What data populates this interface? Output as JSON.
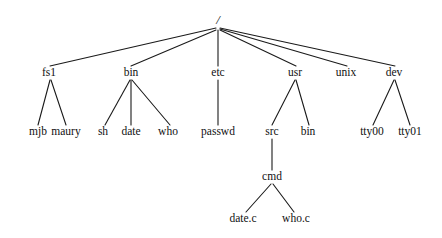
{
  "diagram": {
    "type": "tree",
    "background_color": "#ffffff",
    "line_color": "#1a1a1a",
    "text_color": "#111111",
    "nodes": [
      {
        "id": "root",
        "label": "/",
        "x": 218,
        "y": 24,
        "level": 0
      },
      {
        "id": "fs1",
        "label": "fs1",
        "x": 49,
        "y": 76,
        "level": 1
      },
      {
        "id": "bin",
        "label": "bin",
        "x": 131,
        "y": 76,
        "level": 1
      },
      {
        "id": "etc",
        "label": "etc",
        "x": 218,
        "y": 76,
        "level": 1
      },
      {
        "id": "usr",
        "label": "usr",
        "x": 295,
        "y": 76,
        "level": 1
      },
      {
        "id": "unix",
        "label": "unix",
        "x": 346,
        "y": 76,
        "level": 1
      },
      {
        "id": "dev",
        "label": "dev",
        "x": 394,
        "y": 76,
        "level": 1
      },
      {
        "id": "mjb",
        "label": "mjb",
        "x": 38,
        "y": 135,
        "level": 2
      },
      {
        "id": "maury",
        "label": "maury",
        "x": 66,
        "y": 135,
        "level": 2
      },
      {
        "id": "sh",
        "label": "sh",
        "x": 103,
        "y": 135,
        "level": 2
      },
      {
        "id": "date",
        "label": "date",
        "x": 131,
        "y": 135,
        "level": 2
      },
      {
        "id": "who",
        "label": "who",
        "x": 168,
        "y": 135,
        "level": 2
      },
      {
        "id": "passwd",
        "label": "passwd",
        "x": 218,
        "y": 135,
        "level": 2
      },
      {
        "id": "src",
        "label": "src",
        "x": 272,
        "y": 135,
        "level": 2
      },
      {
        "id": "usrbin",
        "label": "bin",
        "x": 308,
        "y": 135,
        "level": 2
      },
      {
        "id": "tty00",
        "label": "tty00",
        "x": 372,
        "y": 135,
        "level": 2
      },
      {
        "id": "tty01",
        "label": "tty01",
        "x": 410,
        "y": 135,
        "level": 2
      },
      {
        "id": "cmd",
        "label": "cmd",
        "x": 272,
        "y": 180,
        "level": 3
      },
      {
        "id": "datec",
        "label": "date.c",
        "x": 243,
        "y": 222,
        "level": 4
      },
      {
        "id": "whoc",
        "label": "who.c",
        "x": 296,
        "y": 222,
        "level": 4
      }
    ],
    "edges": [
      {
        "from": "root",
        "to": "fs1",
        "x1": 216,
        "y1": 28,
        "x2": 50,
        "y2": 66
      },
      {
        "from": "root",
        "to": "bin",
        "x1": 216,
        "y1": 30,
        "x2": 131,
        "y2": 66
      },
      {
        "from": "root",
        "to": "etc",
        "x1": 218,
        "y1": 30,
        "x2": 218,
        "y2": 66
      },
      {
        "from": "root",
        "to": "usr",
        "x1": 220,
        "y1": 30,
        "x2": 296,
        "y2": 66
      },
      {
        "from": "root",
        "to": "unix",
        "x1": 220,
        "y1": 29,
        "x2": 347,
        "y2": 66
      },
      {
        "from": "root",
        "to": "dev",
        "x1": 220,
        "y1": 28,
        "x2": 395,
        "y2": 66
      },
      {
        "from": "fs1",
        "to": "mjb",
        "x1": 50,
        "y1": 80,
        "x2": 38,
        "y2": 125
      },
      {
        "from": "fs1",
        "to": "maury",
        "x1": 51,
        "y1": 80,
        "x2": 66,
        "y2": 125
      },
      {
        "from": "bin",
        "to": "sh",
        "x1": 130,
        "y1": 80,
        "x2": 105,
        "y2": 125
      },
      {
        "from": "bin",
        "to": "date",
        "x1": 131,
        "y1": 80,
        "x2": 131,
        "y2": 125
      },
      {
        "from": "bin",
        "to": "who",
        "x1": 132,
        "y1": 80,
        "x2": 170,
        "y2": 125
      },
      {
        "from": "etc",
        "to": "passwd",
        "x1": 218,
        "y1": 80,
        "x2": 218,
        "y2": 125
      },
      {
        "from": "usr",
        "to": "src",
        "x1": 295,
        "y1": 80,
        "x2": 272,
        "y2": 125
      },
      {
        "from": "usr",
        "to": "usrbin",
        "x1": 296,
        "y1": 80,
        "x2": 309,
        "y2": 125
      },
      {
        "from": "dev",
        "to": "tty00",
        "x1": 394,
        "y1": 80,
        "x2": 373,
        "y2": 125
      },
      {
        "from": "dev",
        "to": "tty01",
        "x1": 395,
        "y1": 80,
        "x2": 410,
        "y2": 125
      },
      {
        "from": "src",
        "to": "cmd",
        "x1": 272,
        "y1": 139,
        "x2": 272,
        "y2": 170
      },
      {
        "from": "cmd",
        "to": "datec",
        "x1": 271,
        "y1": 184,
        "x2": 246,
        "y2": 212
      },
      {
        "from": "cmd",
        "to": "whoc",
        "x1": 273,
        "y1": 184,
        "x2": 294,
        "y2": 212
      }
    ]
  }
}
